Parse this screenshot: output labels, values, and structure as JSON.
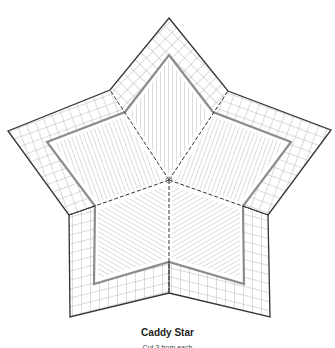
{
  "diagram": {
    "title": "Caddy Star",
    "subtitle": "Cut 3 from each",
    "colors": {
      "outline": "#333333",
      "grid": "#9a9a9a",
      "frame": "#8c8c8c",
      "hatch": "#a8a8a8",
      "seam": "#333333",
      "background": "#ffffff"
    },
    "center": [
      169,
      180
    ],
    "outer_star": [
      [
        169,
        18
      ],
      [
        228,
        91
      ],
      [
        331,
        130
      ],
      [
        268,
        215
      ],
      [
        270,
        317
      ],
      [
        169,
        293
      ],
      [
        70,
        317
      ],
      [
        69,
        215
      ],
      [
        8,
        131
      ],
      [
        110,
        90
      ]
    ],
    "inner_frame": [
      [
        169,
        55
      ],
      [
        213,
        112
      ],
      [
        291,
        142
      ],
      [
        243,
        206
      ],
      [
        244,
        284
      ],
      [
        169,
        262
      ],
      [
        94,
        284
      ],
      [
        95,
        206
      ],
      [
        47,
        142
      ],
      [
        125,
        112
      ]
    ],
    "seam_ends": [
      [
        110,
        90
      ],
      [
        228,
        91
      ],
      [
        268,
        215
      ],
      [
        169,
        293
      ],
      [
        69,
        215
      ]
    ]
  }
}
